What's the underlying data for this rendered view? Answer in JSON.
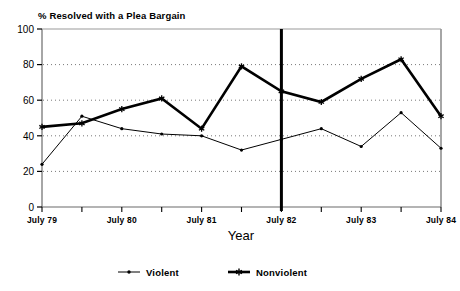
{
  "chart_data": {
    "type": "line",
    "title": "% Resolved with a Plea Bargain",
    "xlabel": "Year",
    "ylabel": "",
    "ylim": [
      0,
      100
    ],
    "yticks": [
      0,
      20,
      40,
      60,
      80,
      100
    ],
    "grid": true,
    "grid_style": "dotted-horizontal",
    "legend_position": "bottom-center",
    "x": [
      "July 79",
      "Jan 80",
      "July 80",
      "Jan 81",
      "July 81",
      "Jan 82",
      "July 82",
      "Jan 83",
      "July 83",
      "Jan 84",
      "July 84"
    ],
    "xtick_labels": [
      "July 79",
      "July 80",
      "July 81",
      "July 82",
      "July 83",
      "July 84"
    ],
    "xtick_label_indices": [
      0,
      2,
      4,
      6,
      8,
      10
    ],
    "series": [
      {
        "name": "Violent",
        "marker": "dot",
        "line_width": 1,
        "color": "#000000",
        "values": [
          24,
          51,
          44,
          41,
          40,
          32,
          38,
          44,
          34,
          53,
          33
        ]
      },
      {
        "name": "Nonviolent",
        "marker": "star",
        "line_width": 2.6,
        "color": "#000000",
        "values": [
          45,
          47,
          55,
          61,
          44,
          79,
          65,
          59,
          72,
          83,
          51
        ]
      }
    ],
    "annotations": [
      {
        "type": "vertical-reference-line",
        "x_index": 6,
        "label": "July 82",
        "color": "#000000",
        "width": 3
      }
    ]
  },
  "legend": {
    "items": [
      {
        "label": "Violent",
        "marker": "dot"
      },
      {
        "label": "Nonviolent",
        "marker": "star"
      }
    ]
  }
}
